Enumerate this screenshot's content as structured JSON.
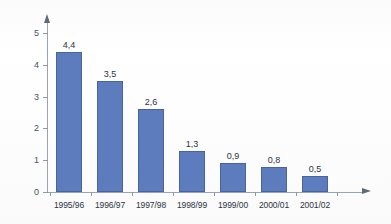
{
  "chart_data": {
    "type": "bar",
    "title": "",
    "subtitle": "",
    "xlabel": "",
    "ylabel": "",
    "categories": [
      "1995/96",
      "1996/97",
      "1997/98",
      "1998/99",
      "1999/00",
      "2000/01",
      "2001/02"
    ],
    "values": [
      4.4,
      3.5,
      2.6,
      1.3,
      0.9,
      0.8,
      0.5
    ],
    "value_labels": [
      "4,4",
      "3,5",
      "2,6",
      "1,3",
      "0,9",
      "0,8",
      "0,5"
    ],
    "ylim": [
      0,
      5
    ],
    "yticks": [
      0,
      1,
      2,
      3,
      4,
      5
    ],
    "ytick_labels": [
      "0",
      "1",
      "2",
      "3",
      "4",
      "5"
    ],
    "grid": false,
    "legend": null,
    "decimal_separator": ",",
    "series": [
      {
        "name": "",
        "values": [
          4.4,
          3.5,
          2.6,
          1.3,
          0.9,
          0.8,
          0.5
        ],
        "color": "#5c7cbe"
      }
    ],
    "colors": {
      "bar_fill": "#5c7cbe",
      "bar_stroke": "#47649f",
      "axis": "#9aa3b0",
      "text": "#2c3340",
      "background": "#fdfdfd"
    }
  }
}
